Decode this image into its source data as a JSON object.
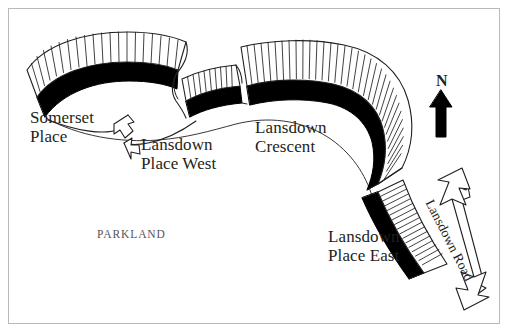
{
  "figure": {
    "kind": "street-plan-map",
    "background_color": "#ffffff",
    "border_color": "#b9b9b9",
    "ink_color": "#231f20",
    "width": 510,
    "height": 334
  },
  "labels": {
    "somerset_place": "Somerset\nPlace",
    "somerset_place_line1": "Somerset",
    "somerset_place_line2": "Place",
    "lansdown_place_west_line1": "Lansdown",
    "lansdown_place_west_line2": "Place West",
    "lansdown_crescent_line1": "Lansdown",
    "lansdown_crescent_line2": "Crescent",
    "lansdown_place_east_line1": "Lansdown",
    "lansdown_place_east_line2": "Place East",
    "lansdown_road": "Lansdown Road",
    "parkland": "PARKLAND",
    "north": "N"
  },
  "legend_semantics": {
    "black_band": "building frontage / terrace range",
    "hatched_strips": "individual plot / garden divisions",
    "thin_line": "parkland boundary",
    "outlined_arrow": "route indicator"
  },
  "map_features": [
    {
      "name": "Somerset Place",
      "type": "crescent-terrace",
      "plot_count": 20,
      "band_color": "#000000"
    },
    {
      "name": "Lansdown Place West",
      "type": "terrace",
      "plot_count": 10,
      "band_color": "#000000"
    },
    {
      "name": "Lansdown Crescent",
      "type": "crescent-terrace",
      "plot_count": 28,
      "band_color": "#000000"
    },
    {
      "name": "Lansdown Place East",
      "type": "terrace",
      "plot_count": 17,
      "band_color": "#000000"
    },
    {
      "name": "Lansdown Road",
      "type": "road",
      "arrow": "double-headed"
    },
    {
      "name": "Parkland",
      "type": "open-space"
    }
  ],
  "compass": {
    "direction": "N",
    "arrow": "north-arrow",
    "color": "#000000"
  }
}
